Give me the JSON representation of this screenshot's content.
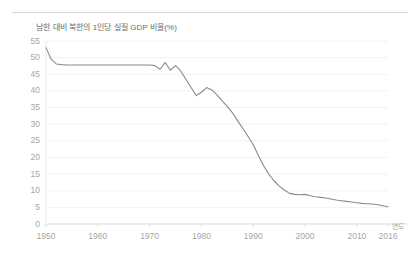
{
  "figure": {
    "background_color": "#ffffff",
    "rule_color": "#d9d9d9",
    "axis_label_color": "#a6a6a6",
    "title_color": "#6b6b6b",
    "line_color": "#8a8a8a",
    "gridline_color": "#f2f2f2"
  },
  "chart_data": {
    "type": "line",
    "title": "남한 대비 북한의 1인당 실질 GDP 비율(%)",
    "subtitle": "",
    "xlabel": "연도",
    "ylabel": "",
    "xlim": [
      1950,
      2016
    ],
    "ylim": [
      0,
      55
    ],
    "grid": true,
    "legend": "none",
    "x_tick_labels": [
      "1950",
      "1960",
      "1970",
      "1980",
      "1990",
      "2000",
      "2010",
      "2016"
    ],
    "x_ticks": [
      1950,
      1960,
      1970,
      1980,
      1990,
      2000,
      2010,
      2016
    ],
    "y_tick_labels": [
      "0",
      "5",
      "10",
      "15",
      "20",
      "25",
      "30",
      "35",
      "40",
      "45",
      "50",
      "55"
    ],
    "y_ticks": [
      0,
      5,
      10,
      15,
      20,
      25,
      30,
      35,
      40,
      45,
      50,
      55
    ],
    "series": [
      {
        "name": "남한 대비 북한의 1인당 실질 GDP 비율(%)",
        "color": "#8a8a8a",
        "x": [
          1950,
          1951,
          1952,
          1953,
          1954,
          1955,
          1956,
          1957,
          1958,
          1959,
          1960,
          1961,
          1962,
          1963,
          1964,
          1965,
          1966,
          1967,
          1968,
          1969,
          1970,
          1971,
          1972,
          1973,
          1974,
          1975,
          1976,
          1977,
          1978,
          1979,
          1980,
          1981,
          1982,
          1983,
          1984,
          1985,
          1986,
          1987,
          1988,
          1989,
          1990,
          1991,
          1992,
          1993,
          1994,
          1995,
          1996,
          1997,
          1998,
          1999,
          2000,
          2001,
          2002,
          2003,
          2004,
          2005,
          2006,
          2007,
          2008,
          2009,
          2010,
          2011,
          2012,
          2013,
          2014,
          2015,
          2016
        ],
        "values": [
          53.0,
          49.5,
          48.1,
          47.9,
          47.8,
          47.8,
          47.8,
          47.8,
          47.8,
          47.8,
          47.8,
          47.8,
          47.8,
          47.8,
          47.8,
          47.8,
          47.8,
          47.8,
          47.8,
          47.8,
          47.8,
          47.6,
          46.5,
          48.5,
          46.2,
          47.6,
          46.0,
          43.5,
          41.0,
          38.6,
          39.6,
          41.0,
          40.3,
          38.8,
          37.0,
          35.3,
          33.4,
          31.0,
          28.7,
          26.3,
          23.8,
          20.5,
          17.5,
          15.0,
          13.0,
          11.4,
          10.2,
          9.2,
          8.9,
          8.8,
          8.9,
          8.5,
          8.2,
          8.0,
          7.8,
          7.5,
          7.2,
          7.0,
          6.8,
          6.6,
          6.4,
          6.2,
          6.1,
          6.0,
          5.8,
          5.5,
          5.2
        ]
      }
    ]
  }
}
